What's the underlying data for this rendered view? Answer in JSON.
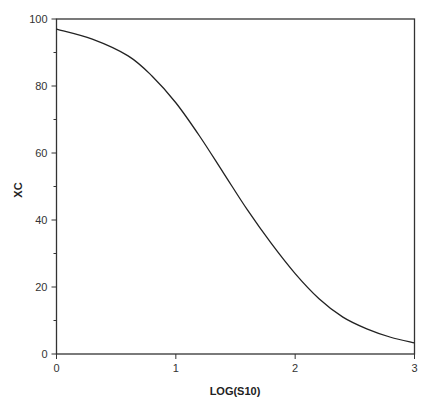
{
  "chart_data": {
    "type": "line",
    "title": "",
    "xlabel": "LOG(S10)",
    "ylabel": "XC",
    "xlim": [
      0,
      3
    ],
    "ylim": [
      0,
      100
    ],
    "x_ticks": [
      "0",
      "1",
      "2",
      "3"
    ],
    "y_ticks": [
      "0",
      "20",
      "40",
      "60",
      "80",
      "100"
    ],
    "grid": false,
    "legend": null,
    "series": [
      {
        "name": "XC",
        "x": [
          0,
          0.3,
          0.6,
          0.8,
          1.0,
          1.2,
          1.4,
          1.6,
          1.8,
          2.0,
          2.2,
          2.4,
          2.6,
          2.8,
          3.0
        ],
        "values": [
          97,
          94,
          89,
          83,
          75,
          65,
          54,
          43,
          33,
          24,
          16.5,
          11,
          7.5,
          5,
          3.3
        ]
      }
    ]
  },
  "colors": {
    "line": "#222222",
    "axis": "#333333",
    "background": "#ffffff"
  }
}
